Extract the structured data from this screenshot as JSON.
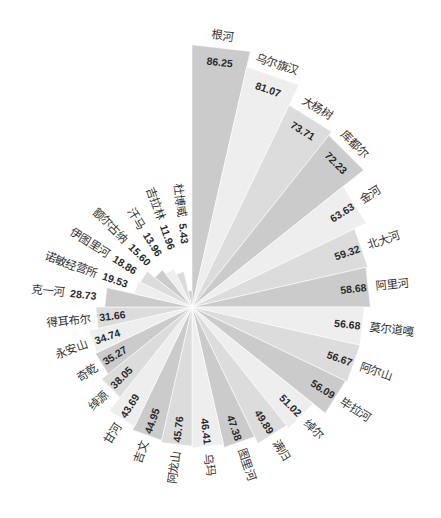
{
  "style": {
    "palette": [
      "#cbcbcb",
      "#eeeeee",
      "#dcdcdc"
    ],
    "label_color": "#333333",
    "background": "#ffffff"
  },
  "chart_data": {
    "type": "bar",
    "subtype": "polar-rose",
    "title": "",
    "xlabel": "",
    "ylabel": "",
    "legend": null,
    "grid": false,
    "start_angle_deg": 0,
    "direction": "clockwise",
    "categories": [
      "根河",
      "乌尔旗汉",
      "大杨树",
      "库都尔",
      "金河",
      "北大河",
      "阿里河",
      "莫尔道嘎",
      "阿尔山",
      "毕拉河",
      "绰尔",
      "满归",
      "图里河",
      "乌玛",
      "阿龙山",
      "吉文",
      "甘河",
      "绰源",
      "奇乾",
      "永安山",
      "得耳布尔",
      "克一河",
      "诺敏经营所",
      "伊图里河",
      "额尔古纳",
      "汗马",
      "吉拉林",
      "杜博威"
    ],
    "values": [
      86.25,
      81.07,
      73.71,
      72.23,
      63.63,
      59.32,
      58.68,
      56.68,
      56.67,
      56.09,
      51.02,
      49.89,
      47.38,
      46.41,
      45.76,
      44.95,
      43.69,
      38.05,
      35.27,
      34.74,
      31.66,
      28.73,
      19.53,
      18.86,
      15.6,
      13.96,
      11.96,
      5.43
    ],
    "value_labels": [
      "86.25",
      "81.07",
      "73.71",
      "72.23",
      "63.63",
      "59.32",
      "58.68",
      "56.68",
      "56.67",
      "56.09",
      "51.02",
      "49.89",
      "47.38",
      "46.41",
      "45.76",
      "44.95",
      "43.69",
      "38.05",
      "35.27",
      "34.74",
      "31.66",
      "28.73",
      "19.53",
      "18.86",
      "15.60",
      "13.96",
      "11.96",
      "5.43"
    ],
    "ylim": [
      0,
      86.25
    ]
  }
}
